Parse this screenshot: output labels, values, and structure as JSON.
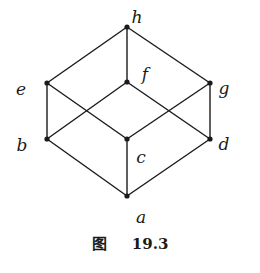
{
  "diagram": {
    "type": "hasse-diagram",
    "nodes": [
      {
        "id": "h",
        "label": "h",
        "x": 127,
        "y": 27,
        "lx": 137,
        "ly": 18
      },
      {
        "id": "e",
        "label": "e",
        "x": 47,
        "y": 83,
        "lx": 21,
        "ly": 90
      },
      {
        "id": "f",
        "label": "f",
        "x": 127,
        "y": 82,
        "lx": 145,
        "ly": 75
      },
      {
        "id": "g",
        "label": "g",
        "x": 210,
        "y": 83,
        "lx": 224,
        "ly": 89
      },
      {
        "id": "b",
        "label": "b",
        "x": 47,
        "y": 139,
        "lx": 22,
        "ly": 146
      },
      {
        "id": "c",
        "label": "c",
        "x": 127,
        "y": 139,
        "lx": 141,
        "ly": 158
      },
      {
        "id": "d",
        "label": "d",
        "x": 210,
        "y": 139,
        "lx": 224,
        "ly": 145
      },
      {
        "id": "a",
        "label": "a",
        "x": 127,
        "y": 196,
        "lx": 141,
        "ly": 218
      }
    ],
    "edges": [
      [
        "h",
        "e"
      ],
      [
        "h",
        "f"
      ],
      [
        "h",
        "g"
      ],
      [
        "e",
        "b"
      ],
      [
        "e",
        "c"
      ],
      [
        "f",
        "b"
      ],
      [
        "f",
        "d"
      ],
      [
        "g",
        "c"
      ],
      [
        "g",
        "d"
      ],
      [
        "b",
        "a"
      ],
      [
        "c",
        "a"
      ],
      [
        "d",
        "a"
      ]
    ]
  },
  "caption": {
    "prefix": "图",
    "number": "19.3"
  }
}
